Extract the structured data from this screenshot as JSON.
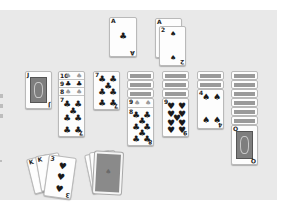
{
  "game": {
    "name": "Solitaire",
    "type": "Klondike"
  },
  "colors": {
    "felt": "#e9e9e9",
    "card_face": "#fdfdfd",
    "card_back": "#8a8a8a",
    "border": "#b9b9b9"
  },
  "foundations": [
    {
      "rank": "A",
      "suit": "♣",
      "label": "Ace of clubs"
    },
    {
      "rank": "2",
      "suit": "♠",
      "label": "2 of spades",
      "stacked_under": "A"
    }
  ],
  "tableau": [
    {
      "column": 1,
      "face_down": 0,
      "face_up": [
        {
          "rank": "J",
          "suit": "♠",
          "label": "Jack of spades"
        }
      ]
    },
    {
      "column": 2,
      "face_down": 0,
      "face_up": [
        {
          "rank": "10",
          "suit": "♠"
        },
        {
          "rank": "9",
          "suit": "♣"
        },
        {
          "rank": "8",
          "suit": "♠"
        },
        {
          "rank": "7",
          "suit": "♣",
          "label": "7 of clubs"
        }
      ]
    },
    {
      "column": 3,
      "face_down": 0,
      "face_up": [
        {
          "rank": "7",
          "suit": "♣",
          "label": "7 of clubs"
        }
      ]
    },
    {
      "column": 4,
      "face_down": 3,
      "face_up": [
        {
          "rank": "9",
          "suit": "♠"
        },
        {
          "rank": "8",
          "suit": "♣",
          "label": "8 of clubs"
        }
      ]
    },
    {
      "column": 5,
      "face_down": 3,
      "face_up": [
        {
          "rank": "9",
          "suit": "♥",
          "label": "9 of hearts"
        }
      ]
    },
    {
      "column": 6,
      "face_down": 2,
      "face_up": [
        {
          "rank": "4",
          "suit": "♠",
          "label": "4 of spades"
        }
      ]
    },
    {
      "column": 7,
      "face_down": 6,
      "face_up": [
        {
          "rank": "Q",
          "suit": "♣",
          "label": "Queen of clubs"
        }
      ]
    }
  ],
  "waste": {
    "top": {
      "rank": "3",
      "suit": "♥",
      "label": "3 of hearts"
    },
    "fanned_count": 3,
    "fanned_ranks": [
      "K",
      "K",
      "3"
    ]
  },
  "stock": {
    "label": "Deck",
    "face_down": true
  }
}
